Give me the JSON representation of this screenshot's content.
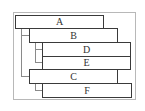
{
  "diagram": {
    "type": "tree",
    "nodes": [
      {
        "id": "A",
        "label": "A",
        "level": 0
      },
      {
        "id": "B",
        "label": "B",
        "level": 1,
        "parent": "A"
      },
      {
        "id": "D",
        "label": "D",
        "level": 2,
        "parent": "B"
      },
      {
        "id": "E",
        "label": "E",
        "level": 2,
        "parent": "B"
      },
      {
        "id": "C",
        "label": "C",
        "level": 1,
        "parent": "A"
      },
      {
        "id": "F",
        "label": "F",
        "level": 2,
        "parent": "C"
      }
    ],
    "edges": [
      [
        "A",
        "B"
      ],
      [
        "A",
        "C"
      ],
      [
        "B",
        "D"
      ],
      [
        "B",
        "E"
      ],
      [
        "C",
        "F"
      ]
    ],
    "colors": {
      "border": "#3a3a3a",
      "connector": "#8a8a8a",
      "frame": "#b8b8b8",
      "text": "#333333"
    }
  }
}
